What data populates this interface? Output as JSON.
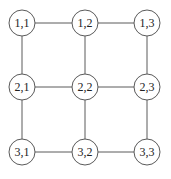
{
  "diagram": {
    "type": "grid-graph",
    "rows": 3,
    "cols": 3,
    "nodes": [
      {
        "id": "1,1",
        "label": "1,1",
        "x": 22,
        "y": 23
      },
      {
        "id": "1,2",
        "label": "1,2",
        "x": 85,
        "y": 23
      },
      {
        "id": "1,3",
        "label": "1,3",
        "x": 147,
        "y": 23
      },
      {
        "id": "2,1",
        "label": "2,1",
        "x": 22,
        "y": 87
      },
      {
        "id": "2,2",
        "label": "2,2",
        "x": 85,
        "y": 87
      },
      {
        "id": "2,3",
        "label": "2,3",
        "x": 147,
        "y": 87
      },
      {
        "id": "3,1",
        "label": "3,1",
        "x": 22,
        "y": 152
      },
      {
        "id": "3,2",
        "label": "3,2",
        "x": 85,
        "y": 152
      },
      {
        "id": "3,3",
        "label": "3,3",
        "x": 147,
        "y": 152
      }
    ],
    "edges": [
      [
        "1,1",
        "1,2"
      ],
      [
        "1,2",
        "1,3"
      ],
      [
        "2,1",
        "2,2"
      ],
      [
        "2,2",
        "2,3"
      ],
      [
        "3,1",
        "3,2"
      ],
      [
        "3,2",
        "3,3"
      ],
      [
        "1,1",
        "2,1"
      ],
      [
        "2,1",
        "3,1"
      ],
      [
        "1,2",
        "2,2"
      ],
      [
        "2,2",
        "3,2"
      ],
      [
        "1,3",
        "2,3"
      ],
      [
        "2,3",
        "3,3"
      ]
    ],
    "node_radius": 13,
    "colors": {
      "stroke": "#5a5a5a",
      "fill": "#ffffff",
      "text": "#222222"
    }
  }
}
